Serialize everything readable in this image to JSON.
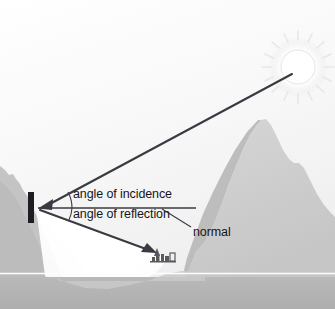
{
  "figure": {
    "type": "physics-ray-diagram",
    "width": 335,
    "height": 309,
    "background_color": "#ffffff"
  },
  "labels": {
    "angle_of_incidence": "angle of incidence",
    "angle_of_reflection": "angle of reflection",
    "normal": "normal"
  },
  "colors": {
    "sky_top": "#ffffff",
    "sky_bottom": "#f2f2f2",
    "mountain": "#cfcfcf",
    "mountain_shadow": "#bdbdbd",
    "left_hill": "#c4c4c4",
    "water": "#b4b4b4",
    "horizon_line": "#fdfdfd",
    "light_beam": "#ffffff",
    "ray": "#3a3a42",
    "mirror": "#1d1d22",
    "text": "#16161a",
    "sun_disc": "#ffffff",
    "sun_glow": "#eeeeee",
    "village": "#5a5a5e"
  },
  "elements": {
    "sun": {
      "name": "sun",
      "cx": 298,
      "cy": 67,
      "r": 17,
      "ray_count": 16
    },
    "mirror": {
      "name": "mirror",
      "x": 28,
      "y": 192,
      "width": 6,
      "height": 31
    },
    "vertex": {
      "x": 38,
      "y": 208
    },
    "incident_ray": {
      "from_x": 292,
      "from_y": 72,
      "to_x": 40,
      "to_y": 207,
      "arrow": "at-mirror"
    },
    "reflected_ray": {
      "from_x": 40,
      "from_y": 210,
      "to_x": 156,
      "to_y": 253,
      "arrow": "at-village"
    },
    "normal_line": {
      "from_x": 38,
      "from_y": 208,
      "to_x": 196,
      "to_y": 208
    },
    "incidence_arc": {
      "radius": 34,
      "from_deg": -28,
      "to_deg": 0
    },
    "reflection_arc": {
      "radius": 34,
      "from_deg": 0,
      "to_deg": 21
    },
    "normal_leader": {
      "from_x": 191,
      "from_y": 228,
      "to_x": 163,
      "to_y": 210
    },
    "village": {
      "x": 152,
      "y": 248,
      "description": "village with church spire"
    },
    "horizon": {
      "y": 273
    }
  }
}
